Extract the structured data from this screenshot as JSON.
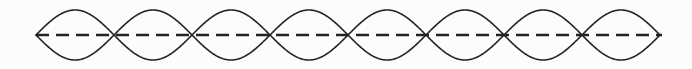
{
  "figure": {
    "name": "standing-wave-diagram",
    "background_color": "#fcfcfc",
    "width": 692,
    "height": 69
  },
  "chart_data": {
    "type": "line",
    "subtitle": "",
    "xlabel": "",
    "ylabel": "",
    "grid": false,
    "legend_position": "none",
    "xlim": [
      36,
      660
    ],
    "ylim": [
      -25,
      25
    ],
    "axis_y_pixel": 35,
    "antinode_count": 8,
    "node_count": 9,
    "lobe_width": 78,
    "amplitude": 25,
    "node_positions": [
      36,
      114,
      192,
      270,
      348,
      426,
      504,
      582,
      660
    ],
    "antinode_positions": [
      75,
      153,
      231,
      309,
      387,
      465,
      543,
      621
    ],
    "series": [
      {
        "name": "envelope-upper",
        "description": "Positive phase sine envelope",
        "color": "#232323",
        "stroke_width": 1.6,
        "phase": 0,
        "style": "solid"
      },
      {
        "name": "envelope-lower",
        "description": "Negative phase sine envelope (inverted)",
        "color": "#232323",
        "stroke_width": 1.6,
        "phase": 180,
        "style": "solid"
      }
    ],
    "axis_line": {
      "name": "equilibrium-axis",
      "description": "Dashed equilibrium / rest position line",
      "color": "#232323",
      "stroke_width": 2.6,
      "style": "dashed",
      "dash_length": 13,
      "gap_length": 7,
      "x_start": 36,
      "x_end": 662,
      "y": 35
    },
    "annotations": []
  }
}
